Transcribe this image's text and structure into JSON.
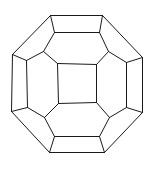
{
  "figure": {
    "stroke_color": "#1a1a1a",
    "background": "#ffffff"
  },
  "vertices": {
    "o1": [
      50,
      15
    ],
    "o2": [
      102,
      15
    ],
    "o3": [
      142,
      57
    ],
    "o4": [
      142,
      112
    ],
    "o5": [
      104,
      152
    ],
    "o6": [
      49,
      152
    ],
    "o7": [
      11,
      111
    ],
    "o8": [
      12,
      54
    ],
    "t1": [
      54,
      32
    ],
    "t2": [
      99,
      32
    ],
    "r1": [
      126,
      62
    ],
    "r2": [
      126,
      107
    ],
    "b1": [
      99,
      136
    ],
    "b2": [
      54,
      136
    ],
    "l1": [
      27,
      107
    ],
    "l2": [
      26,
      60
    ],
    "c1": [
      43,
      51
    ],
    "c2": [
      108,
      51
    ],
    "c3": [
      109,
      117
    ],
    "c4": [
      44,
      117
    ],
    "s1": [
      57,
      63
    ],
    "s2": [
      96,
      64
    ],
    "s3": [
      96,
      102
    ],
    "s4": [
      58,
      103
    ]
  },
  "edges": [
    [
      "o1",
      "o2"
    ],
    [
      "o2",
      "o3"
    ],
    [
      "o3",
      "o4"
    ],
    [
      "o4",
      "o5"
    ],
    [
      "o5",
      "o6"
    ],
    [
      "o6",
      "o7"
    ],
    [
      "o7",
      "o8"
    ],
    [
      "o8",
      "o1"
    ],
    [
      "o1",
      "t1"
    ],
    [
      "o2",
      "t2"
    ],
    [
      "t1",
      "t2"
    ],
    [
      "o3",
      "r1"
    ],
    [
      "o4",
      "r2"
    ],
    [
      "r1",
      "r2"
    ],
    [
      "o5",
      "b1"
    ],
    [
      "o6",
      "b2"
    ],
    [
      "b1",
      "b2"
    ],
    [
      "o7",
      "l1"
    ],
    [
      "o8",
      "l2"
    ],
    [
      "l1",
      "l2"
    ],
    [
      "t1",
      "c1"
    ],
    [
      "c1",
      "l2"
    ],
    [
      "t2",
      "c2"
    ],
    [
      "c2",
      "r1"
    ],
    [
      "r2",
      "c3"
    ],
    [
      "c3",
      "b1"
    ],
    [
      "b2",
      "c4"
    ],
    [
      "c4",
      "l1"
    ],
    [
      "c1",
      "s1"
    ],
    [
      "c2",
      "s2"
    ],
    [
      "c3",
      "s3"
    ],
    [
      "c4",
      "s4"
    ],
    [
      "s1",
      "s2"
    ],
    [
      "s2",
      "s3"
    ],
    [
      "s3",
      "s4"
    ],
    [
      "s4",
      "s1"
    ]
  ]
}
